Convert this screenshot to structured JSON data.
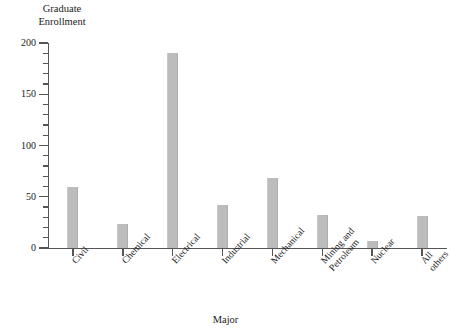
{
  "chart_data": {
    "type": "bar",
    "title": "",
    "xlabel": "Major",
    "ylabel": "Graduate\nEnrollment",
    "categories": [
      "Civil",
      "Chemical",
      "Electrical",
      "Industrial",
      "Mechanical",
      "Mining and\nPetroleum",
      "Nuclear",
      "All others"
    ],
    "values": [
      60,
      23,
      190,
      42,
      68,
      32,
      7,
      31
    ],
    "ylim": [
      0,
      200
    ],
    "ytick_labels": [
      "0",
      "50",
      "100",
      "150",
      "200"
    ],
    "ytick_values": [
      0,
      50,
      100,
      150,
      200
    ],
    "yminor_step": 10,
    "grid": false,
    "legend": null,
    "bar_color": "#bcbcbc",
    "axis_color": "#555555",
    "text_color": "#1a1a1a"
  }
}
